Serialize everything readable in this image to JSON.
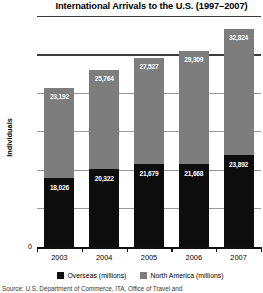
{
  "chart_data": {
    "type": "bar",
    "subtype": "stacked-bar",
    "title": "International Arrivals to the U.S. (1997–2007)",
    "xlabel": "",
    "ylabel": "Individuals",
    "ylim": [
      0,
      60000
    ],
    "ytick_values": [
      0,
      10000,
      20000,
      30000,
      40000,
      50000,
      60000
    ],
    "ytick_labels": [
      "0",
      "10,000",
      "20,000",
      "30,000",
      "40,000",
      "50,000",
      "60,000"
    ],
    "grid": true,
    "legend_position": "bottom",
    "categories": [
      "2003",
      "2004",
      "2005",
      "2006",
      "2007"
    ],
    "series": [
      {
        "name": "Overseas (millions)",
        "color": "#0d0d0d",
        "values": [
          18026,
          20322,
          21679,
          21668,
          23892
        ],
        "labels": [
          "18,026",
          "20,322",
          "21,679",
          "21,668",
          "23,892"
        ]
      },
      {
        "name": "North America (millions)",
        "color": "#7d7d7d",
        "values": [
          23192,
          25764,
          27527,
          29309,
          32824
        ],
        "labels": [
          "23,192",
          "25,764",
          "27,527",
          "29,309",
          "32,824"
        ]
      }
    ],
    "totals": [
      41218,
      46086,
      49206,
      50977,
      56716
    ]
  },
  "source_note": "Source: U.S. Department of Commerce, ITA, Office of Travel and"
}
